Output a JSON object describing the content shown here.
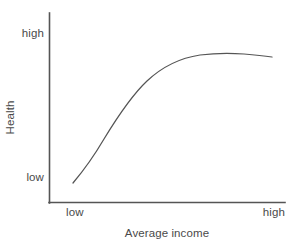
{
  "figure": {
    "width": 299,
    "height": 252,
    "background_color": "#ffffff",
    "ink_color": "#555555"
  },
  "axes": {
    "y_title": "Health",
    "x_title": "Average income",
    "y_ticks": [
      "high",
      "low"
    ],
    "x_ticks": [
      "low",
      "high"
    ]
  },
  "chart_data": {
    "type": "line",
    "title": "",
    "subtitle": "",
    "xlabel": "Average income",
    "ylabel": "Health",
    "xlim": [
      0,
      1
    ],
    "ylim": [
      0,
      1
    ],
    "xtick_labels": [
      "low",
      "high"
    ],
    "xtick_values": [
      0.1,
      1.0
    ],
    "ytick_labels": [
      "low",
      "high"
    ],
    "ytick_values": [
      0.105,
      0.865
    ],
    "grid": false,
    "legend": null,
    "annotations": [],
    "series": [
      {
        "name": "Health vs average income",
        "description": "Concave increasing curve that rises steeply at low income then flattens to a plateau, dipping imperceptibly at the far right (diminishing returns).",
        "x": [
          0.102,
          0.15,
          0.216,
          0.3,
          0.403,
          0.5,
          0.6,
          0.64,
          0.7,
          0.785,
          0.85,
          0.915,
          1.0
        ],
        "y": [
          0.105,
          0.22,
          0.35,
          0.47,
          0.585,
          0.675,
          0.735,
          0.757,
          0.778,
          0.793,
          0.797,
          0.795,
          0.79
        ]
      }
    ]
  },
  "curve_path": "M 73,183 C 84,170 94,156 104,139 C 118,116 131,96 147,81 C 163,66 180,58 200,55 C 216,53 230,53 244,54 C 256,55 265,56 272,57",
  "geometry": {
    "y_axis_x": 49.5,
    "y_axis_top": 13,
    "y_axis_bottom": 203,
    "x_axis_y": 202.5,
    "x_axis_left": 49,
    "x_axis_right": 285
  }
}
